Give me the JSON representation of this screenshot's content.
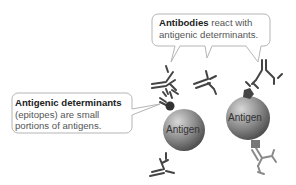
{
  "callouts": {
    "antibodies": {
      "bold": "Antibodies",
      "rest_line1": " react with",
      "line2": "antigenic determinants."
    },
    "determinants": {
      "bold": "Antigenic determinants",
      "line2": "(epitopes) are small",
      "line3": "portions of antigens."
    }
  },
  "antigens": [
    {
      "label": "Antigen"
    },
    {
      "label": "Antigen"
    }
  ],
  "colors": {
    "callout_border": "#b5b5b5",
    "callout_fill": "#ffffff",
    "antigen_dark": "#555555",
    "antigen_light": "#bdbdbd",
    "antibody": "#444444",
    "antibody_light": "#8a8a8a",
    "epitope": "#333333"
  }
}
